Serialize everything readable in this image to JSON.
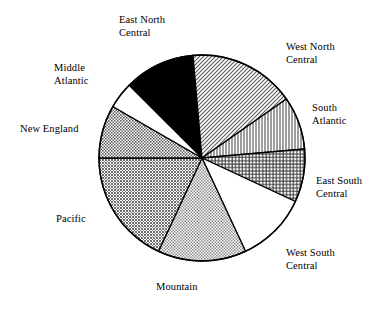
{
  "chart_data": {
    "type": "pie",
    "title": "",
    "subtitle": "",
    "xlabel": "",
    "ylabel": "",
    "legend_position": "none",
    "grid": false,
    "labels_outside": true,
    "start_angle_deg": 95,
    "direction": "clockwise",
    "center_px": [
      202,
      158
    ],
    "radius_px": 103,
    "categories": [
      "East North Central",
      "West North Central",
      "South Atlantic",
      "East South Central",
      "West South Central",
      "Mountain",
      "Pacific",
      "New England",
      "Middle Atlantic"
    ],
    "values": [
      11.1,
      16.7,
      8.3,
      8.3,
      11.1,
      13.9,
      16.7,
      8.3,
      5.6
    ],
    "slices": [
      {
        "name": "East North Central",
        "label": "East North\nCentral",
        "value": 11.1,
        "start_deg": 95,
        "end_deg": 135,
        "fill": "solid-black",
        "fill_color": "#000000"
      },
      {
        "name": "West North Central",
        "label": "West North\nCentral",
        "value": 16.7,
        "start_deg": 35,
        "end_deg": 95,
        "fill": "diagonal-hatch-light",
        "fill_color": "#c9c9c9"
      },
      {
        "name": "South Atlantic",
        "label": "South\nAtlantic",
        "value": 8.3,
        "start_deg": 5,
        "end_deg": 35,
        "fill": "vertical-lines",
        "fill_color": "#d2d2d2"
      },
      {
        "name": "East South Central",
        "label": "East South\nCentral",
        "value": 8.3,
        "start_deg": -25,
        "end_deg": 5,
        "fill": "cross-hatch-grid",
        "fill_color": "#b4b4b4"
      },
      {
        "name": "West South Central",
        "label": "West South\nCentral",
        "value": 11.1,
        "start_deg": -65,
        "end_deg": -25,
        "fill": "white",
        "fill_color": "#ffffff"
      },
      {
        "name": "Mountain",
        "label": "Mountain",
        "value": 13.9,
        "start_deg": -115,
        "end_deg": -65,
        "fill": "stipple-light",
        "fill_color": "#cccccc"
      },
      {
        "name": "Pacific",
        "label": "Pacific",
        "value": 16.7,
        "start_deg": -180,
        "end_deg": -115,
        "fill": "stipple-medium",
        "fill_color": "#a8a8a8"
      },
      {
        "name": "New England",
        "label": "New England",
        "value": 8.3,
        "start_deg": 150,
        "end_deg": 180,
        "fill": "checker-medium",
        "fill_color": "#9e9e9e"
      },
      {
        "name": "Middle Atlantic",
        "label": "Middle\nAtlantic",
        "value": 5.6,
        "start_deg": 135,
        "end_deg": 150,
        "fill": "white",
        "fill_color": "#ffffff"
      }
    ],
    "colors": {
      "outline": "#000000",
      "background": "#ffffff",
      "text": "#000000"
    }
  }
}
